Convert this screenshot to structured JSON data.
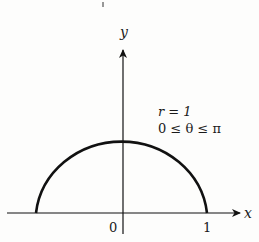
{
  "figure": {
    "type": "polar-curve-plot",
    "curve": {
      "description": "upper semicircle",
      "equation_label": "r = 1",
      "domain_label": "0 ≤ θ ≤ π",
      "stroke_color": "#111111"
    },
    "axes": {
      "x_label": "x",
      "y_label": "y",
      "origin_label": "0",
      "x_tick_label": "1",
      "axis_color": "#111111"
    },
    "top_mark": "|"
  }
}
